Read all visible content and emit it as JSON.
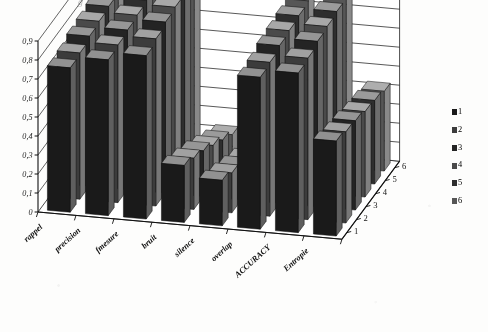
{
  "figure": {
    "cut_off_title": "g p",
    "background_color": "#fdfdfc"
  },
  "chart_data": {
    "type": "bar",
    "subtype": "3d-column",
    "title": "",
    "xlabel": "",
    "ylabel": "",
    "zlabel": "",
    "grid": true,
    "legend_position": "right",
    "ylim": [
      0,
      0.9
    ],
    "ytick_labels": [
      "0",
      "0,1",
      "0,2",
      "0,3",
      "0,4",
      "0,5",
      "0,6",
      "0,7",
      "0,8",
      "0,9"
    ],
    "ytick_values": [
      0,
      0.1,
      0.2,
      0.3,
      0.4,
      0.5,
      0.6,
      0.7,
      0.8,
      0.9
    ],
    "categories": [
      "rappel",
      "precision",
      "fmesure",
      "bruit",
      "silence",
      "overlap",
      "ACCURACY",
      "Entropie"
    ],
    "depth_labels": [
      "1",
      "2",
      "3",
      "4",
      "5",
      "6"
    ],
    "legend_labels": [
      "1",
      "2",
      "3",
      "4",
      "5",
      "6"
    ],
    "series_colors": [
      "#1a1a1a",
      "#3c3c3c",
      "#242424",
      "#4a4a4a",
      "#2e2e2e",
      "#565656"
    ],
    "series": [
      {
        "name": "1",
        "values": [
          0.76,
          0.82,
          0.86,
          0.3,
          0.24,
          0.8,
          0.84,
          0.5
        ]
      },
      {
        "name": "2",
        "values": [
          0.77,
          0.83,
          0.88,
          0.27,
          0.21,
          0.81,
          0.85,
          0.48
        ]
      },
      {
        "name": "3",
        "values": [
          0.79,
          0.84,
          0.9,
          0.24,
          0.18,
          0.83,
          0.87,
          0.47
        ]
      },
      {
        "name": "4",
        "values": [
          0.8,
          0.85,
          0.91,
          0.2,
          0.15,
          0.84,
          0.88,
          0.45
        ]
      },
      {
        "name": "5",
        "values": [
          0.81,
          0.86,
          0.92,
          0.16,
          0.12,
          0.85,
          0.89,
          0.44
        ]
      },
      {
        "name": "6",
        "values": [
          0.82,
          0.87,
          0.92,
          0.12,
          0.09,
          0.86,
          0.9,
          0.42
        ]
      }
    ]
  }
}
